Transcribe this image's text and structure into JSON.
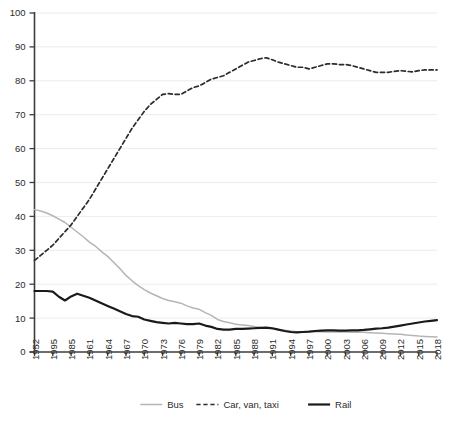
{
  "chart_data": {
    "type": "line",
    "title": "",
    "subtitle": "",
    "xlabel": "",
    "ylabel": "",
    "ylim": [
      0,
      100
    ],
    "grid": true,
    "legend_position": "bottom",
    "y_ticks": [
      "0",
      "10",
      "20",
      "30",
      "40",
      "50",
      "60",
      "70",
      "80",
      "90",
      "100"
    ],
    "y_tick_values": [
      0,
      10,
      20,
      30,
      40,
      50,
      60,
      70,
      80,
      90,
      100
    ],
    "categories": [
      "1952",
      "1995",
      "1985",
      "1961",
      "1964",
      "1967",
      "1970",
      "1973",
      "1976",
      "1979",
      "1982",
      "1985",
      "1988",
      "1991",
      "1994",
      "1997",
      "2000",
      "2003",
      "2006",
      "2009",
      "2012",
      "2015",
      "2018"
    ],
    "x_positions": [
      1952,
      1955,
      1958,
      1961,
      1964,
      1967,
      1970,
      1973,
      1976,
      1979,
      1982,
      1985,
      1988,
      1991,
      1994,
      1997,
      2000,
      2003,
      2006,
      2009,
      2012,
      2015,
      2018
    ],
    "x_step_years": 1,
    "series": [
      {
        "name": "Bus",
        "color": "#b5b5b5",
        "style": "solid",
        "width": 1.5,
        "x": [
          1952,
          1953,
          1954,
          1955,
          1956,
          1957,
          1958,
          1959,
          1960,
          1961,
          1962,
          1963,
          1964,
          1965,
          1966,
          1967,
          1968,
          1969,
          1970,
          1971,
          1972,
          1973,
          1974,
          1975,
          1976,
          1977,
          1978,
          1979,
          1980,
          1981,
          1982,
          1983,
          1984,
          1985,
          1986,
          1987,
          1988,
          1989,
          1990,
          1991,
          1992,
          1993,
          1994,
          1995,
          1996,
          1997,
          1998,
          1999,
          2000,
          2001,
          2002,
          2003,
          2004,
          2005,
          2006,
          2007,
          2008,
          2009,
          2010,
          2011,
          2012,
          2013,
          2014,
          2015,
          2016,
          2017,
          2018
        ],
        "values": [
          42,
          41.6,
          41,
          40.2,
          39.2,
          38.2,
          36.8,
          35.4,
          34,
          32.4,
          31.2,
          29.6,
          28.2,
          26.4,
          24.6,
          22.6,
          21,
          19.6,
          18.4,
          17.4,
          16.6,
          15.8,
          15.2,
          14.8,
          14.4,
          13.6,
          13,
          12.6,
          11.6,
          10.8,
          9.6,
          9,
          8.6,
          8.2,
          8,
          7.8,
          7.5,
          7.2,
          7,
          6.8,
          6.6,
          6.4,
          6.2,
          6,
          6,
          6,
          6,
          6,
          5.9,
          5.9,
          5.9,
          5.9,
          5.8,
          5.8,
          5.8,
          5.7,
          5.6,
          5.5,
          5.4,
          5.3,
          5.2,
          5,
          4.9,
          4.7,
          4.6,
          4.5,
          4.4
        ]
      },
      {
        "name": "Car, van, taxi",
        "color": "#2b2b2b",
        "style": "dashed",
        "width": 1.7,
        "x": [
          1952,
          1953,
          1954,
          1955,
          1956,
          1957,
          1958,
          1959,
          1960,
          1961,
          1962,
          1963,
          1964,
          1965,
          1966,
          1967,
          1968,
          1969,
          1970,
          1971,
          1972,
          1973,
          1974,
          1975,
          1976,
          1977,
          1978,
          1979,
          1980,
          1981,
          1982,
          1983,
          1984,
          1985,
          1986,
          1987,
          1988,
          1989,
          1990,
          1991,
          1992,
          1993,
          1994,
          1995,
          1996,
          1997,
          1998,
          1999,
          2000,
          2001,
          2002,
          2003,
          2004,
          2005,
          2006,
          2007,
          2008,
          2009,
          2010,
          2011,
          2012,
          2013,
          2014,
          2015,
          2016,
          2017,
          2018
        ],
        "values": [
          27,
          28.5,
          30,
          31.5,
          33.5,
          35.5,
          37.5,
          40,
          42.5,
          45,
          48,
          51,
          54,
          57,
          60,
          63,
          66,
          68.5,
          71,
          73,
          74.5,
          76,
          76.2,
          76,
          76,
          77,
          78,
          78.5,
          79.5,
          80.5,
          81,
          81.5,
          82.5,
          83.5,
          84.5,
          85.5,
          86,
          86.5,
          86.8,
          86.2,
          85.5,
          85,
          84.5,
          84,
          84,
          83.5,
          84,
          84.5,
          85,
          85,
          84.8,
          84.8,
          84.5,
          84,
          83.5,
          83,
          82.5,
          82.5,
          82.5,
          82.8,
          83,
          82.8,
          82.6,
          83,
          83.2,
          83.2,
          83.2
        ]
      },
      {
        "name": "Rail",
        "color": "#1a1a1a",
        "style": "solid",
        "width": 2.2,
        "x": [
          1952,
          1953,
          1954,
          1955,
          1956,
          1957,
          1958,
          1959,
          1960,
          1961,
          1962,
          1963,
          1964,
          1965,
          1966,
          1967,
          1968,
          1969,
          1970,
          1971,
          1972,
          1973,
          1974,
          1975,
          1976,
          1977,
          1978,
          1979,
          1980,
          1981,
          1982,
          1983,
          1984,
          1985,
          1986,
          1987,
          1988,
          1989,
          1990,
          1991,
          1992,
          1993,
          1994,
          1995,
          1996,
          1997,
          1998,
          1999,
          2000,
          2001,
          2002,
          2003,
          2004,
          2005,
          2006,
          2007,
          2008,
          2009,
          2010,
          2011,
          2012,
          2013,
          2014,
          2015,
          2016,
          2017,
          2018
        ],
        "values": [
          18,
          18,
          18,
          17.8,
          16.3,
          15.2,
          16.4,
          17.2,
          16.6,
          16,
          15.2,
          14.4,
          13.6,
          12.8,
          12,
          11.2,
          10.6,
          10.4,
          9.6,
          9.2,
          8.8,
          8.6,
          8.4,
          8.6,
          8.4,
          8.2,
          8.2,
          8.4,
          7.8,
          7.4,
          6.8,
          6.6,
          6.6,
          6.8,
          6.8,
          6.9,
          7,
          7.1,
          7.2,
          7,
          6.6,
          6.2,
          5.9,
          5.8,
          5.9,
          6,
          6.2,
          6.3,
          6.4,
          6.4,
          6.3,
          6.3,
          6.4,
          6.4,
          6.5,
          6.7,
          6.9,
          7,
          7.2,
          7.5,
          7.8,
          8.1,
          8.4,
          8.7,
          9,
          9.2,
          9.4
        ]
      }
    ],
    "legend": [
      {
        "label": "Bus",
        "color": "#b5b5b5",
        "style": "solid",
        "width": 1.5
      },
      {
        "label": "Car, van, taxi",
        "color": "#2b2b2b",
        "style": "dashed",
        "width": 1.7
      },
      {
        "label": "Rail",
        "color": "#1a1a1a",
        "style": "solid",
        "width": 2.2
      }
    ]
  }
}
